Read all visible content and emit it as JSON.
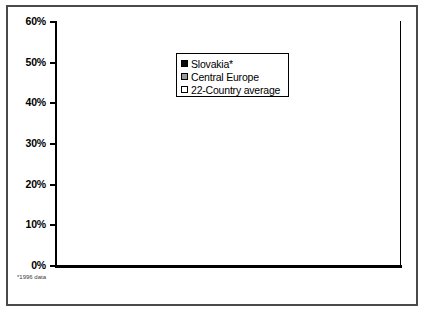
{
  "chart_data": {
    "type": "bar",
    "title": "",
    "subtitle": "",
    "xlabel": "",
    "ylabel": "",
    "categories": [
      "Public Sector",
      "Philanthropy",
      "Fees"
    ],
    "series": [
      {
        "name": "Slovakia*",
        "color": "#0a0a0a",
        "values": [
          21.9,
          33.3,
          54.9
        ]
      },
      {
        "name": "Central Europe",
        "color": "#9a9a9a",
        "values": [
          21.9,
          20.5,
          46.1
        ]
      },
      {
        "name": "22-Country average",
        "color": "#ffffff",
        "values": [
          40.1,
          10.5,
          49.4
        ]
      }
    ],
    "series_values_by_category": [
      {
        "category": "Public Sector",
        "Slovakia*": 21.9,
        "Central Europe": 33.3,
        "22-Country average": 40.1
      },
      {
        "category": "Philanthropy",
        "Slovakia*": 23.3,
        "Central Europe": 20.5,
        "22-Country average": 10.5
      },
      {
        "category": "Fees",
        "Slovakia*": 54.9,
        "Central Europe": 46.1,
        "22-Country average": 49.4
      }
    ],
    "data_labels": [
      [
        "21.9%",
        "33.3%",
        "40.1%"
      ],
      [
        "23.3%",
        "20.5%",
        "10.5%"
      ],
      [
        "54.9%",
        "46.1%",
        "49.4%"
      ]
    ],
    "ylim": [
      0,
      60
    ],
    "ytick_labels": [
      "0%",
      "10%",
      "20%",
      "30%",
      "40%",
      "50%",
      "60%"
    ],
    "ytick_values": [
      0,
      10,
      20,
      30,
      40,
      50,
      60
    ],
    "grid": false,
    "legend_position": "upper-center",
    "footnote": "*1996 data"
  },
  "legend": {
    "items": [
      {
        "label": "Slovakia*"
      },
      {
        "label": "Central Europe"
      },
      {
        "label": "22-Country average"
      }
    ]
  },
  "axis": {
    "y_ticks": [
      {
        "label": "60%",
        "value": 60
      },
      {
        "label": "50%",
        "value": 50
      },
      {
        "label": "40%",
        "value": 40
      },
      {
        "label": "30%",
        "value": 30
      },
      {
        "label": "20%",
        "value": 20
      },
      {
        "label": "10%",
        "value": 10
      },
      {
        "label": "0%",
        "value": 0
      }
    ]
  },
  "categories": [
    {
      "label": "Public Sector"
    },
    {
      "label": "Philanthropy"
    },
    {
      "label": "Fees"
    }
  ],
  "footnote": {
    "text": "*1996 data"
  }
}
